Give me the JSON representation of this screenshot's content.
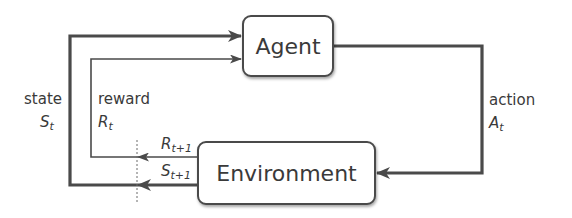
{
  "diagram": {
    "type": "agent-environment-loop",
    "nodes": {
      "agent": {
        "label": "Agent"
      },
      "environment": {
        "label": "Environment"
      }
    },
    "labels": {
      "state": {
        "word": "state",
        "symbol": "S",
        "subscript": "t"
      },
      "reward": {
        "word": "reward",
        "symbol": "R",
        "subscript": "t"
      },
      "action": {
        "word": "action",
        "symbol": "A",
        "subscript": "t"
      },
      "next_reward": {
        "symbol": "R",
        "subscript": "t+1"
      },
      "next_state": {
        "symbol": "S",
        "subscript": "t+1"
      }
    },
    "edges": [
      {
        "from": "agent",
        "to": "environment",
        "label": "action A_t"
      },
      {
        "from": "environment",
        "to": "agent",
        "label": "state S_t (from S_t+1)"
      },
      {
        "from": "environment",
        "to": "agent",
        "label": "reward R_t (from R_t+1)"
      }
    ],
    "colors": {
      "line": "#4a4a4a",
      "box_border": "#4a4a4a",
      "text": "#3a3a3a"
    }
  }
}
